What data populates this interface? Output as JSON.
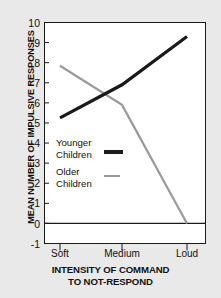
{
  "chart_data": {
    "type": "line",
    "title": "",
    "xlabel": "INTENSITY OF COMMAND TO NOT-RESPOND",
    "xlabel_line1": "INTENSITY OF COMMAND",
    "xlabel_line2": "TO NOT-RESPOND",
    "ylabel": "MEAN NUMBER OF IMPULSIVE RESPONSES",
    "categories": [
      "Soft",
      "Medium",
      "Loud"
    ],
    "ylim": [
      -1,
      10
    ],
    "yticks": [
      10,
      9,
      8,
      7,
      6,
      5,
      4,
      3,
      2,
      1,
      0,
      -1
    ],
    "grid": false,
    "legend_position": "inside-left-center",
    "zero_line": 0,
    "series": [
      {
        "name": "Younger Children",
        "name_line1": "Younger",
        "name_line2": "Children",
        "color": "#1a1a1a",
        "width": 3.2,
        "values": [
          5.25,
          6.9,
          9.3
        ]
      },
      {
        "name": "Older Children",
        "name_line1": "Older",
        "name_line2": "Children",
        "color": "#9a9a9a",
        "width": 2.2,
        "values": [
          7.85,
          5.9,
          0.0
        ]
      }
    ]
  },
  "colors": {
    "background": "#e9e9e9",
    "plot_background": "#ffffff",
    "axis": "#1a1a1a",
    "younger": "#1a1a1a",
    "older": "#9a9a9a"
  }
}
